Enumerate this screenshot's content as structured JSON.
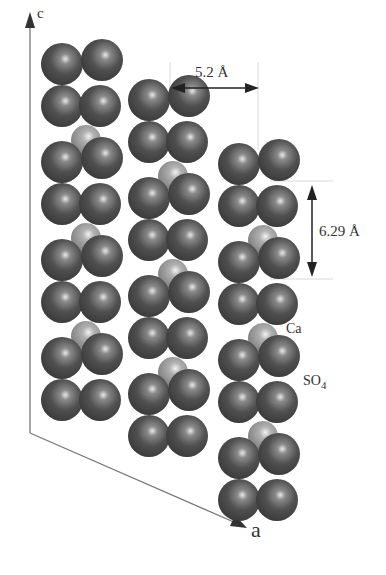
{
  "diagram": {
    "type": "crystal-structure",
    "axes": {
      "c_label": "c",
      "a_label": "a"
    },
    "dimensions": {
      "horizontal_spacing": "5.2 Å",
      "vertical_spacing": "6.29 Å"
    },
    "legend": {
      "ca_label": "Ca",
      "so4_label": "SO",
      "so4_subscript": "4"
    },
    "colors": {
      "so4_sphere": "#4a4a4a",
      "ca_sphere": "#9a9a9a",
      "axis_line": "#777777",
      "arrow": "#222222",
      "guide_line": "#cccccc"
    },
    "columns": [
      {
        "name": "column-1",
        "x": 81,
        "top": 62,
        "units": 4
      },
      {
        "name": "column-2",
        "x": 168,
        "top": 98,
        "units": 4
      },
      {
        "name": "column-3",
        "x": 258,
        "top": 162,
        "units": 4
      }
    ]
  }
}
